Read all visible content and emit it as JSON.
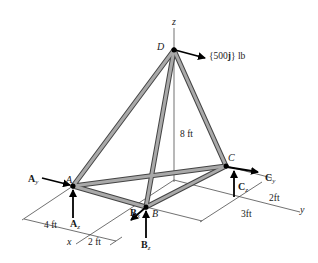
{
  "diagram": {
    "type": "space-truss",
    "axes": {
      "z": "z",
      "x": "x",
      "y": "y"
    },
    "points": {
      "A": "A",
      "B": "B",
      "C": "C",
      "D": "D"
    },
    "load": {
      "label_pre": "{500",
      "label_bold": "j",
      "label_post": "} lb"
    },
    "reactions": {
      "Ay": {
        "main": "A",
        "sub": "y"
      },
      "Az": {
        "main": "A",
        "sub": "z"
      },
      "Bx": {
        "main": "B",
        "sub": "x"
      },
      "Bz": {
        "main": "B",
        "sub": "z"
      },
      "Cy": {
        "main": "C",
        "sub": "y"
      },
      "Cz": {
        "main": "C",
        "sub": "z"
      }
    },
    "dimensions": {
      "height": "8 ft",
      "a_to_x": "4 ft",
      "x_to_b": "2 ft",
      "c_offset": "2ft",
      "b_to_y": "3ft"
    },
    "members": [
      "AD",
      "BD",
      "CD",
      "AB",
      "AC",
      "BC"
    ],
    "colors": {
      "member": "#8a8a8a",
      "member_edge": "#444444",
      "arrow": "#000000",
      "line": "#333333"
    }
  }
}
